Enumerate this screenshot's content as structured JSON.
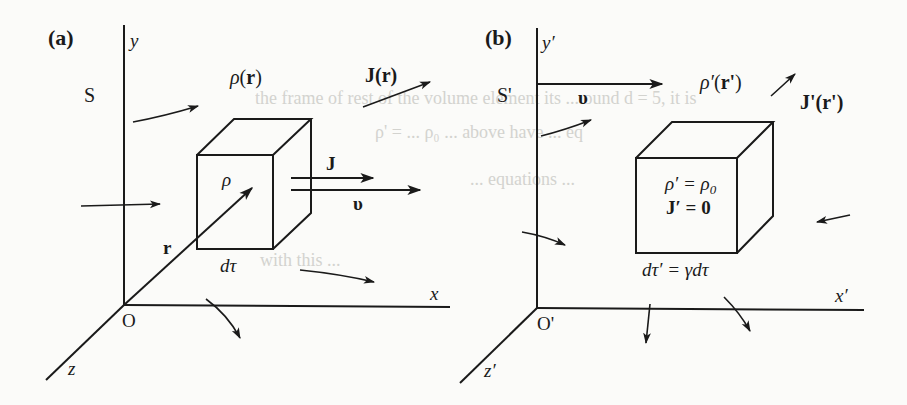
{
  "figure": {
    "background": "#fbfbf9",
    "ink_color": "#1a1a1a",
    "bleed_through_text": [
      "the frame of rest of the volume element its ... ound d = 5, it is",
      "ρ' = ... ρ₀ ... above have ... eq",
      "... equations ... ",
      "with this ..."
    ]
  },
  "panel_a": {
    "label": "(a)",
    "frame": "S",
    "origin": "O",
    "axes": {
      "x": "x",
      "y": "y",
      "z": "z"
    },
    "field_labels": {
      "density": "ρ(r)",
      "current": "J(r)"
    },
    "volume_element": {
      "density_label": "ρ",
      "volume_label": "dτ",
      "current_arrow_label": "J",
      "velocity_arrow_label": "υ",
      "position_vector_label": "r"
    }
  },
  "panel_b": {
    "label": "(b)",
    "frame": "S'",
    "origin": "O'",
    "axes": {
      "x": "x′",
      "y": "y′",
      "z": "z′"
    },
    "frame_velocity_label": "υ",
    "field_labels": {
      "density": "ρ′(r′)",
      "current": "J′(r′)"
    },
    "volume_element": {
      "density_label": "ρ′ = ρ₀",
      "current_label": "J′ = 0",
      "volume_label": "dτ′ = γdτ"
    }
  }
}
